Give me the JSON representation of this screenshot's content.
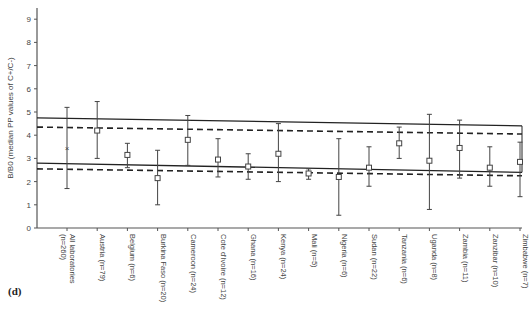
{
  "panel_label": "(d)",
  "chart_data": {
    "type": "scatter",
    "subtype": "error-bar",
    "title": "",
    "xlabel": "",
    "ylabel": "B/B0 (median PP values of C+/C-)",
    "ylim": [
      0,
      9.5
    ],
    "yticks": [
      0,
      1,
      2,
      3,
      4,
      5,
      6,
      7,
      8,
      9
    ],
    "grid": false,
    "legend": null,
    "categories": [
      "All laboratories (n=260)",
      "Austria (n=79)",
      "Belgium (n=6)",
      "Burkina Faso (n=20)",
      "Cameroon (n=24)",
      "Cote d'Ivoire (n=12)",
      "Ghana (n=16)",
      "Kenya (n=24)",
      "Mali (n=5)",
      "Nigeria (n=6)",
      "Sudan (n=22)",
      "Tanzania (n=6)",
      "Uganda (n=8)",
      "Zambia (n=11)",
      "Zanzibar (n=10)",
      "Zimbabwe (n=7)"
    ],
    "category_lines": [
      [
        "All laboratories",
        "(n=260)"
      ],
      [
        "Austria (n=79)"
      ],
      [
        "Belgium (n=6)"
      ],
      [
        "Burkina Faso (n=20)"
      ],
      [
        "Cameroon (n=24)"
      ],
      [
        "Cote d'Ivoire (n=12)"
      ],
      [
        "Ghana (n=16)"
      ],
      [
        "Kenya (n=24)"
      ],
      [
        "Mali (n=5)"
      ],
      [
        "Nigeria (n=6)"
      ],
      [
        "Sudan (n=22)"
      ],
      [
        "Tanzania (n=6)"
      ],
      [
        "Uganda (n=8)"
      ],
      [
        "Zambia (n=11)"
      ],
      [
        "Zanzibar (n=10)"
      ],
      [
        "Zimbabwe (n=7)"
      ]
    ],
    "series": [
      {
        "name": "Median with range",
        "marker": [
          "x",
          "square",
          "square",
          "square",
          "square",
          "square",
          "square",
          "square",
          "square",
          "square",
          "square",
          "square",
          "square",
          "square",
          "square",
          "square"
        ],
        "values": [
          3.45,
          4.2,
          3.15,
          2.15,
          3.8,
          2.95,
          2.65,
          3.2,
          2.35,
          2.2,
          2.6,
          3.65,
          2.9,
          3.45,
          2.6,
          2.85
        ],
        "upper": [
          5.2,
          5.45,
          3.65,
          3.35,
          4.85,
          3.85,
          3.2,
          4.5,
          2.55,
          3.85,
          3.5,
          4.35,
          4.9,
          4.65,
          3.5,
          3.7
        ],
        "lower": [
          1.7,
          3.0,
          2.6,
          1.0,
          2.7,
          2.2,
          2.1,
          2.0,
          2.1,
          0.55,
          1.8,
          3.0,
          0.8,
          2.15,
          1.8,
          1.35
        ]
      }
    ],
    "reference_lines": [
      {
        "name": "upper-solid",
        "style": "solid",
        "y_start": 4.75,
        "y_end": 4.4
      },
      {
        "name": "upper-dashed",
        "style": "dashed",
        "y_start": 4.35,
        "y_end": 4.05
      },
      {
        "name": "lower-solid",
        "style": "solid",
        "y_start": 2.8,
        "y_end": 2.4
      },
      {
        "name": "lower-dashed",
        "style": "dashed",
        "y_start": 2.55,
        "y_end": 2.25
      }
    ]
  }
}
